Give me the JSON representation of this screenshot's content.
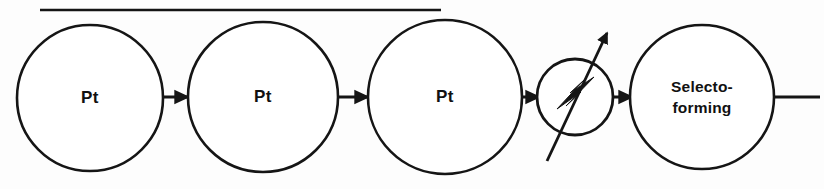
{
  "diagram": {
    "background_color": "#fdfdfd",
    "line_color": "#151515",
    "fill_color": "#ffffff",
    "top_rule": {
      "name": "horizontal-rule",
      "x1": 40,
      "x2": 441,
      "y": 10
    },
    "nodes": [
      {
        "id": "reactor-1",
        "label": "Pt",
        "label_lines": [
          "Pt"
        ],
        "shape": "circle",
        "cx": 90,
        "cy": 98,
        "r": 73
      },
      {
        "id": "reactor-2",
        "label": "Pt",
        "label_lines": [
          "Pt"
        ],
        "shape": "circle",
        "cx": 263,
        "cy": 97,
        "r": 75
      },
      {
        "id": "reactor-3",
        "label": "Pt",
        "label_lines": [
          "Pt"
        ],
        "shape": "circle",
        "cx": 445,
        "cy": 97,
        "r": 77
      },
      {
        "id": "adjustable-unit",
        "label": "",
        "label_lines": [],
        "shape": "circle-with-bolt-and-arrow",
        "cx": 575,
        "cy": 97,
        "r": 38
      },
      {
        "id": "selectoforming-reactor",
        "label": "Selecto- forming",
        "label_lines": [
          "Selecto-",
          "forming"
        ],
        "shape": "circle",
        "cx": 702,
        "cy": 97,
        "r": 72
      }
    ],
    "connectors": [
      {
        "id": "stream-1-2",
        "from": "reactor-1",
        "to": "reactor-2",
        "x1": 163,
        "x2": 189,
        "y": 97,
        "arrowhead": true
      },
      {
        "id": "stream-2-3",
        "from": "reactor-2",
        "to": "reactor-3",
        "x1": 338,
        "x2": 369,
        "y": 97,
        "arrowhead": true
      },
      {
        "id": "stream-3-unit",
        "from": "reactor-3",
        "to": "adjustable-unit",
        "x1": 522,
        "x2": 538,
        "y": 97,
        "arrowhead": true
      },
      {
        "id": "stream-unit-selecto",
        "from": "adjustable-unit",
        "to": "selectoforming-reactor",
        "x1": 613,
        "x2": 631,
        "y": 97,
        "arrowhead": true
      },
      {
        "id": "product-outlet",
        "from": "selectoforming-reactor",
        "to": "",
        "x1": 774,
        "x2": 820,
        "y": 97,
        "arrowhead": false
      }
    ],
    "adjust_arrow": {
      "name": "adjustable-arrow",
      "x1": 547,
      "y1": 161,
      "x2": 607,
      "y2": 33
    },
    "bolt": {
      "name": "lightning-bolt",
      "points": "559,106 581,82 571,92 592,79 569,103 579,93"
    }
  }
}
